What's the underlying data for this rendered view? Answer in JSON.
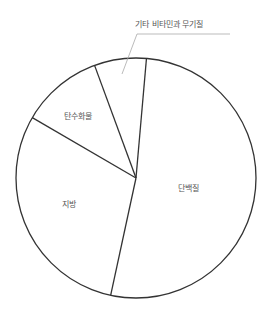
{
  "chart_data": {
    "type": "pie",
    "title": "",
    "categories": [
      "단백질",
      "지방",
      "탄수화물",
      "기타 비타민과 무기질"
    ],
    "values": [
      52,
      30,
      11,
      7
    ],
    "unit": "%",
    "start_angle_deg": 5,
    "direction": "clockwise",
    "legend": "none (inline labels)",
    "annotations": [
      {
        "text": "기타 비타민과 무기질",
        "leader_line": true
      }
    ]
  },
  "labels": {
    "protein": "단백질",
    "fat": "지방",
    "carb": "탄수화물",
    "other": "기타 비타민과 무기질"
  },
  "colors": {
    "stroke": "#333333",
    "fill": "#ffffff",
    "leader": "#aaaaaa",
    "text": "#555555"
  }
}
